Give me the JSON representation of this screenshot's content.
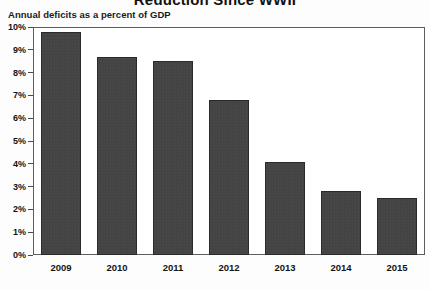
{
  "chart_data": {
    "type": "bar",
    "title": "Reduction Since WWII",
    "subtitle": "Annual deficits as a percent of GDP",
    "xlabel": "",
    "ylabel": "",
    "categories": [
      "2009",
      "2010",
      "2011",
      "2012",
      "2013",
      "2014",
      "2015"
    ],
    "values": [
      9.8,
      8.7,
      8.5,
      6.8,
      4.1,
      2.8,
      2.5
    ],
    "value_unit": "percent of GDP",
    "ylim": [
      0,
      10
    ],
    "ytick_labels": [
      "0%",
      "1%",
      "2%",
      "3%",
      "4%",
      "5%",
      "6%",
      "7%",
      "8%",
      "9%",
      "10%"
    ],
    "ytick_values": [
      0,
      1,
      2,
      3,
      4,
      5,
      6,
      7,
      8,
      9,
      10
    ],
    "grid": false,
    "legend": "none",
    "bar_color": "#3c3c3c",
    "frame_color": "#5d5d5d",
    "background_color": "#ffffff"
  }
}
